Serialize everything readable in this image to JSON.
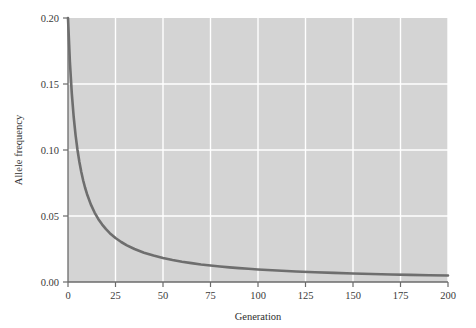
{
  "chart_data": {
    "type": "line",
    "title": "",
    "xlabel": "Generation",
    "ylabel": "Allele frequency",
    "xlim": [
      0,
      200
    ],
    "ylim": [
      0.0,
      0.2
    ],
    "grid": true,
    "legend": null,
    "plot_background": "#d4d4d4",
    "gridline_color": "#ffffff",
    "line_color": "#6e6e6e",
    "line_width": 2.6,
    "axis_color": "#6b6b6b",
    "xticks": [
      0,
      25,
      50,
      75,
      100,
      125,
      150,
      175,
      200
    ],
    "xtick_labels": [
      "0",
      "25",
      "50",
      "75",
      "100",
      "125",
      "150",
      "175",
      "200"
    ],
    "yticks": [
      0.0,
      0.05,
      0.1,
      0.15,
      0.2
    ],
    "ytick_labels": [
      "0.00",
      "0.05",
      "0.10",
      "0.15",
      "0.20"
    ],
    "series": [
      {
        "name": "Allele frequency",
        "x": [
          0,
          1,
          2,
          3,
          4,
          5,
          6,
          7,
          8,
          9,
          10,
          12,
          14,
          16,
          18,
          20,
          22,
          25,
          28,
          31,
          35,
          40,
          45,
          50,
          55,
          60,
          65,
          70,
          75,
          80,
          85,
          90,
          95,
          100,
          110,
          120,
          130,
          140,
          150,
          160,
          170,
          180,
          190,
          200
        ],
        "y": [
          0.2,
          0.1667,
          0.1429,
          0.125,
          0.1111,
          0.1,
          0.0909,
          0.0833,
          0.0769,
          0.0714,
          0.0667,
          0.0588,
          0.0526,
          0.0476,
          0.0435,
          0.04,
          0.037,
          0.0333,
          0.0303,
          0.0278,
          0.025,
          0.0222,
          0.02,
          0.0182,
          0.0167,
          0.0154,
          0.0143,
          0.0133,
          0.0125,
          0.0118,
          0.0111,
          0.0105,
          0.01,
          0.00952,
          0.00869,
          0.008,
          0.00741,
          0.0069,
          0.00645,
          0.00606,
          0.00571,
          0.0054,
          0.00513,
          0.00488
        ]
      }
    ]
  },
  "axes": {
    "x_title": "Generation",
    "y_title": "Allele frequency"
  }
}
